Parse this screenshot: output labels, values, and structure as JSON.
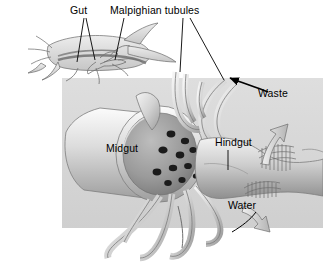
{
  "figure": {
    "kind": "biology-diagram",
    "background_color": "#ffffff",
    "panel_color": "#d8d8d8",
    "ink_color": "#000000"
  },
  "labels": {
    "gut": "Gut",
    "malpighian_tubules": "Malpighian tubules",
    "midgut": "Midgut",
    "hindgut": "Hindgut",
    "waste": "Waste",
    "water": "Water"
  },
  "structures": [
    {
      "name": "grasshopper-habitus",
      "description": "outline side view of grasshopper with internal gut"
    },
    {
      "name": "midgut-cylinder",
      "description": "large cut-open tube, lumen visible"
    },
    {
      "name": "midgut-pores",
      "count": 11,
      "description": "dark openings where tubules join"
    },
    {
      "name": "malpighian-tubules",
      "description": "slender looping tubules"
    },
    {
      "name": "hindgut-rectum",
      "description": "flared chamber with ridged pads"
    }
  ],
  "arrows": [
    {
      "name": "waste-arrow",
      "label": "Waste",
      "direction": "up-left",
      "style": "thin-curved"
    },
    {
      "name": "water-arrow-upper",
      "label": "Water",
      "direction": "up",
      "style": "thick-block"
    },
    {
      "name": "water-arrow-lower",
      "label": "Water",
      "direction": "down-right",
      "style": "thick-block"
    }
  ]
}
